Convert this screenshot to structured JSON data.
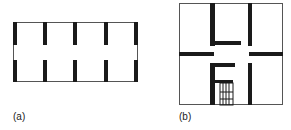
{
  "figure_a": {
    "label": "(a)",
    "outline": {
      "x": 13,
      "y": 22,
      "w": 125,
      "h": 60
    },
    "wall_color": "#1a1a1a",
    "bars_x": [
      13,
      43,
      73,
      104,
      134
    ],
    "bar_width": 4,
    "upper_bar": {
      "y": 22,
      "h": 23
    },
    "lower_bar": {
      "y": 60,
      "h": 22
    }
  },
  "figure_b": {
    "label": "(b)",
    "outline": {
      "x": 179,
      "y": 3,
      "w": 104,
      "h": 102
    },
    "wall_color": "#1a1a1a"
  }
}
